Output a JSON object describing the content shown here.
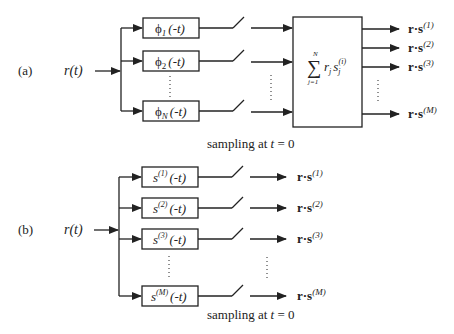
{
  "diagram": {
    "type": "matched-filter-receiver-block-diagrams",
    "part_a": {
      "label": "(a)",
      "input": "r(t)",
      "filters": [
        {
          "phi": "ϕ",
          "sub": "1",
          "arg": "(-t)"
        },
        {
          "phi": "ϕ",
          "sub": "2",
          "arg": "(-t)"
        },
        {
          "phi": "ϕ",
          "sub": "N",
          "arg": "(-t)"
        }
      ],
      "combiner": {
        "sum_symbol": "∑",
        "upper": "N",
        "lower": "j=1",
        "term_r": "r",
        "term_r_sub": "j",
        "term_s": "s",
        "term_s_sub": "j",
        "term_s_sup": "(i)"
      },
      "outputs": [
        {
          "base": "r·s",
          "sup": "(1)"
        },
        {
          "base": "r·s",
          "sup": "(2)"
        },
        {
          "base": "r·s",
          "sup": "(3)"
        },
        {
          "base": "r·s",
          "sup": "(M)"
        }
      ],
      "caption_prefix": "sampling at ",
      "caption_var": "t",
      "caption_suffix": " = 0"
    },
    "part_b": {
      "label": "(b)",
      "input": "r(t)",
      "filters": [
        {
          "s": "s",
          "sup": "(1)",
          "arg": "(-t)"
        },
        {
          "s": "s",
          "sup": "(2)",
          "arg": "(-t)"
        },
        {
          "s": "s",
          "sup": "(3)",
          "arg": "(-t)"
        },
        {
          "s": "s",
          "sup": "(M)",
          "arg": "(-t)"
        }
      ],
      "outputs": [
        {
          "base": "r·s",
          "sup": "(1)"
        },
        {
          "base": "r·s",
          "sup": "(2)"
        },
        {
          "base": "r·s",
          "sup": "(3)"
        },
        {
          "base": "r·s",
          "sup": "(M)"
        }
      ],
      "caption_prefix": "sampling at ",
      "caption_var": "t",
      "caption_suffix": " = 0"
    },
    "colors": {
      "line": "#222222",
      "background": "#ffffff"
    }
  }
}
